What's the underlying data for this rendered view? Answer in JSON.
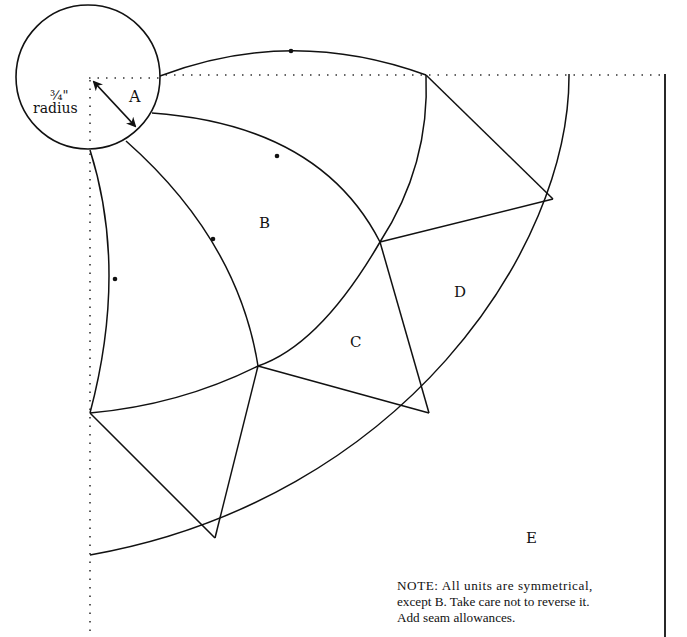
{
  "diagram": {
    "pieces": [
      {
        "id": "A",
        "label": "A"
      },
      {
        "id": "B",
        "label": "B"
      },
      {
        "id": "C",
        "label": "C"
      },
      {
        "id": "D",
        "label": "D"
      },
      {
        "id": "E",
        "label": "E"
      }
    ],
    "radius_annotation": {
      "value": "¾\"",
      "word": "radius"
    },
    "note_lines": [
      "NOTE: All units are symmetrical,",
      "except B. Take care not to reverse it.",
      "Add seam allowances."
    ],
    "colors": {
      "line": "#111111",
      "background": "#ffffff"
    }
  }
}
